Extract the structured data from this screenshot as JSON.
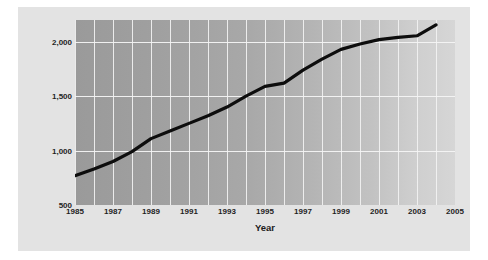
{
  "chart_data": {
    "type": "line",
    "title": "",
    "xlabel": "Year",
    "ylabel": "Number of Inmates (in thousands)",
    "xlim": [
      1985,
      2005
    ],
    "ylim": [
      500,
      2200
    ],
    "grid": true,
    "legend": "none",
    "x_tick_labels": [
      "1985",
      "1987",
      "1989",
      "1991",
      "1993",
      "1995",
      "1997",
      "1999",
      "2001",
      "2003",
      "2005"
    ],
    "x_tick_values": [
      1985,
      1987,
      1989,
      1991,
      1993,
      1995,
      1997,
      1999,
      2001,
      2003,
      2005
    ],
    "x_gridline_values": [
      1985,
      1986,
      1987,
      1988,
      1989,
      1990,
      1991,
      1992,
      1993,
      1994,
      1995,
      1996,
      1997,
      1998,
      1999,
      2000,
      2001,
      2002,
      2003,
      2004,
      2005
    ],
    "y_tick_labels": [
      "500",
      "1,000",
      "1,500",
      "2,000"
    ],
    "y_tick_values": [
      500,
      1000,
      1500,
      2000
    ],
    "y_gridline_values": [
      1000,
      1500,
      2000
    ],
    "series": [
      {
        "name": "Number of Inmates",
        "color": "#0d0d0d",
        "line_width": 3.2,
        "x": [
          1985,
          1986,
          1987,
          1988,
          1989,
          1990,
          1991,
          1992,
          1993,
          1994,
          1995,
          1996,
          1997,
          1998,
          1999,
          2000,
          2001,
          2002,
          2003,
          2004
        ],
        "values": [
          770,
          830,
          900,
          990,
          1110,
          1180,
          1250,
          1320,
          1400,
          1500,
          1590,
          1620,
          1740,
          1840,
          1930,
          1980,
          2020,
          2040,
          2055,
          2155
        ]
      }
    ]
  },
  "figure": {
    "background_color": "#ffffff",
    "panel_color": "#e3e3e3",
    "plot_fill_left": "#9a9a9a",
    "plot_fill_right": "#d6d6d6",
    "gridline_color": "#f2f2f2"
  }
}
